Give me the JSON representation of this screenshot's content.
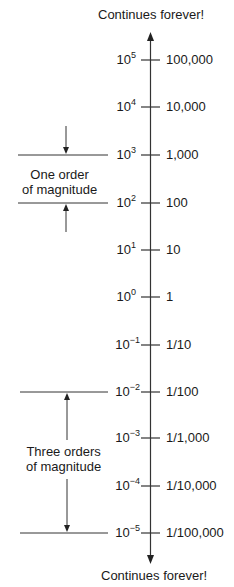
{
  "diagram": {
    "top_label": "Continues forever!",
    "bottom_label": "Continues forever!",
    "ticks": [
      {
        "base": "10",
        "exponent": "5",
        "value": "100,000"
      },
      {
        "base": "10",
        "exponent": "4",
        "value": "10,000"
      },
      {
        "base": "10",
        "exponent": "3",
        "value": "1,000"
      },
      {
        "base": "10",
        "exponent": "2",
        "value": "100"
      },
      {
        "base": "10",
        "exponent": "1",
        "value": "10"
      },
      {
        "base": "10",
        "exponent": "0",
        "value": "1"
      },
      {
        "base": "10",
        "exponent": "−1",
        "value": "1/10"
      },
      {
        "base": "10",
        "exponent": "−2",
        "value": "1/100"
      },
      {
        "base": "10",
        "exponent": "−3",
        "value": "1/1,000"
      },
      {
        "base": "10",
        "exponent": "−4",
        "value": "1/10,000"
      },
      {
        "base": "10",
        "exponent": "−5",
        "value": "1/100,000"
      }
    ],
    "annotations": {
      "one_order": {
        "line1": "One order",
        "line2": "of magnitude"
      },
      "three_orders": {
        "line1": "Three orders",
        "line2": "of magnitude"
      }
    },
    "line_color": "#333333"
  }
}
